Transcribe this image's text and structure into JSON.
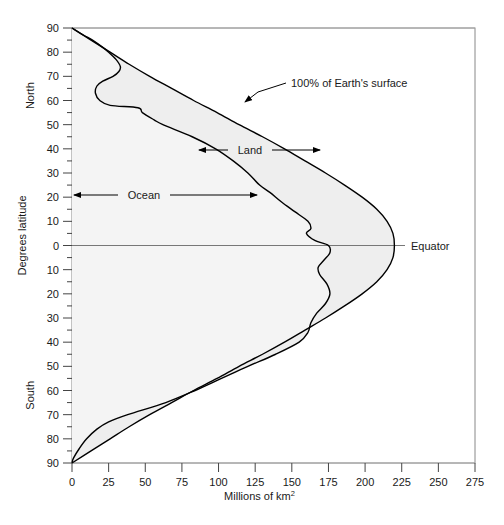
{
  "chart_data": {
    "type": "area",
    "title": "",
    "xlabel": "Millions of km2",
    "xlabel_base": "Millions of km",
    "xlabel_exponent": "2",
    "ylabel": "Degrees latitude",
    "xlim": [
      0,
      275
    ],
    "ylim_north": 90,
    "ylim_south": 90,
    "grid": false,
    "xticks": [
      0,
      25,
      50,
      75,
      100,
      125,
      150,
      175,
      200,
      225,
      250,
      275
    ],
    "xtick_labels": [
      "0",
      "25",
      "50",
      "75",
      "100",
      "125",
      "150",
      "175",
      "200",
      "225",
      "250",
      "275"
    ],
    "yticks_north": [
      90,
      80,
      70,
      60,
      50,
      40,
      30,
      20,
      10,
      0
    ],
    "yticks_south": [
      10,
      20,
      30,
      40,
      50,
      60,
      70,
      80,
      90
    ],
    "ytick_labels_north": [
      "90",
      "80",
      "70",
      "60",
      "50",
      "40",
      "30",
      "20",
      "10",
      "0"
    ],
    "ytick_labels_south": [
      "10",
      "20",
      "30",
      "40",
      "50",
      "60",
      "70",
      "80",
      "90"
    ],
    "ytick_minor_step": 5,
    "hemisphere_labels": {
      "north": "North",
      "south": "South"
    },
    "series": [
      {
        "name": "100% of Earth's surface",
        "description": "Total surface area of Earth per latitude band (outer envelope)",
        "points": [
          {
            "lat": 90,
            "value": 0
          },
          {
            "lat": 85,
            "value": 13
          },
          {
            "lat": 80,
            "value": 26
          },
          {
            "lat": 75,
            "value": 39
          },
          {
            "lat": 70,
            "value": 53
          },
          {
            "lat": 65,
            "value": 68
          },
          {
            "lat": 60,
            "value": 83
          },
          {
            "lat": 55,
            "value": 99
          },
          {
            "lat": 50,
            "value": 114
          },
          {
            "lat": 45,
            "value": 130
          },
          {
            "lat": 40,
            "value": 145
          },
          {
            "lat": 35,
            "value": 159
          },
          {
            "lat": 30,
            "value": 173
          },
          {
            "lat": 25,
            "value": 186
          },
          {
            "lat": 20,
            "value": 198
          },
          {
            "lat": 15,
            "value": 208
          },
          {
            "lat": 10,
            "value": 215
          },
          {
            "lat": 5,
            "value": 219
          },
          {
            "lat": 0,
            "value": 220
          },
          {
            "lat": -5,
            "value": 219
          },
          {
            "lat": -10,
            "value": 215
          },
          {
            "lat": -15,
            "value": 208
          },
          {
            "lat": -20,
            "value": 198
          },
          {
            "lat": -25,
            "value": 186
          },
          {
            "lat": -30,
            "value": 173
          },
          {
            "lat": -35,
            "value": 159
          },
          {
            "lat": -40,
            "value": 145
          },
          {
            "lat": -45,
            "value": 130
          },
          {
            "lat": -50,
            "value": 114
          },
          {
            "lat": -55,
            "value": 99
          },
          {
            "lat": -60,
            "value": 83
          },
          {
            "lat": -65,
            "value": 68
          },
          {
            "lat": -70,
            "value": 53
          },
          {
            "lat": -75,
            "value": 39
          },
          {
            "lat": -80,
            "value": 26
          },
          {
            "lat": -85,
            "value": 13
          },
          {
            "lat": -90,
            "value": 0
          }
        ]
      },
      {
        "name": "Ocean",
        "description": "Ocean area per latitude band (inner curve); region between this curve and the total curve is Land",
        "points": [
          {
            "lat": 90,
            "value": 0
          },
          {
            "lat": 87,
            "value": 8
          },
          {
            "lat": 85,
            "value": 14
          },
          {
            "lat": 82,
            "value": 21
          },
          {
            "lat": 80,
            "value": 25
          },
          {
            "lat": 77,
            "value": 30
          },
          {
            "lat": 74,
            "value": 33
          },
          {
            "lat": 72,
            "value": 32
          },
          {
            "lat": 70,
            "value": 28
          },
          {
            "lat": 68,
            "value": 21
          },
          {
            "lat": 66,
            "value": 17
          },
          {
            "lat": 63,
            "value": 16
          },
          {
            "lat": 60,
            "value": 19
          },
          {
            "lat": 58,
            "value": 26
          },
          {
            "lat": 57,
            "value": 45
          },
          {
            "lat": 55,
            "value": 48
          },
          {
            "lat": 52,
            "value": 56
          },
          {
            "lat": 50,
            "value": 62
          },
          {
            "lat": 45,
            "value": 82
          },
          {
            "lat": 40,
            "value": 98
          },
          {
            "lat": 35,
            "value": 110
          },
          {
            "lat": 30,
            "value": 120
          },
          {
            "lat": 25,
            "value": 128
          },
          {
            "lat": 22,
            "value": 135
          },
          {
            "lat": 18,
            "value": 143
          },
          {
            "lat": 14,
            "value": 152
          },
          {
            "lat": 10,
            "value": 161
          },
          {
            "lat": 7,
            "value": 163
          },
          {
            "lat": 5,
            "value": 160
          },
          {
            "lat": 2,
            "value": 166
          },
          {
            "lat": 0,
            "value": 175
          },
          {
            "lat": -3,
            "value": 176
          },
          {
            "lat": -6,
            "value": 172
          },
          {
            "lat": -9,
            "value": 168
          },
          {
            "lat": -12,
            "value": 169
          },
          {
            "lat": -16,
            "value": 174
          },
          {
            "lat": -20,
            "value": 176
          },
          {
            "lat": -24,
            "value": 173
          },
          {
            "lat": -28,
            "value": 167
          },
          {
            "lat": -32,
            "value": 163
          },
          {
            "lat": -36,
            "value": 161
          },
          {
            "lat": -40,
            "value": 155
          },
          {
            "lat": -45,
            "value": 139
          },
          {
            "lat": -50,
            "value": 120
          },
          {
            "lat": -55,
            "value": 102
          },
          {
            "lat": -60,
            "value": 84
          },
          {
            "lat": -65,
            "value": 64
          },
          {
            "lat": -70,
            "value": 38
          },
          {
            "lat": -73,
            "value": 25
          },
          {
            "lat": -76,
            "value": 17
          },
          {
            "lat": -80,
            "value": 10
          },
          {
            "lat": -84,
            "value": 5
          },
          {
            "lat": -88,
            "value": 1
          },
          {
            "lat": -90,
            "value": 0
          }
        ]
      }
    ],
    "annotations": [
      {
        "name": "total-surface",
        "text": "100% of Earth's surface",
        "style": "leader-line"
      },
      {
        "name": "land",
        "text": "Land",
        "style": "double-arrow"
      },
      {
        "name": "ocean",
        "text": "Ocean",
        "style": "double-arrow"
      },
      {
        "name": "equator",
        "text": "Equator",
        "style": "leader-line"
      }
    ],
    "colors": {
      "curve": "#000000",
      "land_fill": "#eeeeee",
      "ocean_fill": "#f4f4f4",
      "axis": "#555555",
      "text": "#1a1a1a",
      "frame": "#888888"
    }
  }
}
